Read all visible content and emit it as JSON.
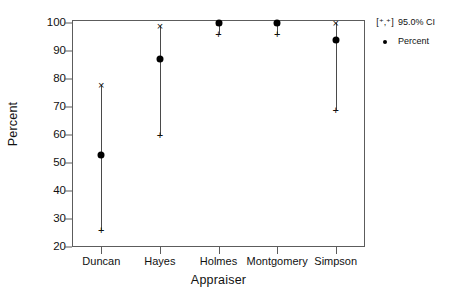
{
  "chart_data": {
    "type": "scatter",
    "title": "",
    "xlabel": "Appraiser",
    "ylabel": "Percent",
    "categories": [
      "Duncan",
      "Hayes",
      "Holmes",
      "Montgomery",
      "Simpson"
    ],
    "values": [
      53,
      87,
      100,
      100,
      94
    ],
    "ci_lower": [
      26,
      60,
      96,
      96,
      69
    ],
    "ci_upper": [
      78,
      99,
      100,
      100,
      100
    ],
    "ylim": [
      20,
      100
    ],
    "yticks": [
      20,
      30,
      40,
      50,
      60,
      70,
      80,
      90,
      100
    ],
    "ytick_labels": [
      "20",
      "30",
      "40",
      "50",
      "60",
      "70",
      "80",
      "90",
      "100"
    ],
    "grid": false,
    "legend_position": "right",
    "series": [
      {
        "name": "Percent",
        "marker": "filled-circle",
        "values": [
          53,
          87,
          100,
          100,
          94
        ]
      },
      {
        "name": "95.0% CI",
        "marker": "[+ , *]",
        "lower": [
          26,
          60,
          96,
          96,
          69
        ],
        "upper": [
          78,
          99,
          100,
          100,
          100
        ]
      }
    ],
    "points": [
      {
        "category": "Duncan",
        "percent": 53,
        "lower": 26,
        "upper": 78
      },
      {
        "category": "Hayes",
        "percent": 87,
        "lower": 60,
        "upper": 99
      },
      {
        "category": "Holmes",
        "percent": 100,
        "lower": 96,
        "upper": 100
      },
      {
        "category": "Montgomery",
        "percent": 100,
        "lower": 96,
        "upper": 100
      },
      {
        "category": "Simpson",
        "percent": 94,
        "lower": 69,
        "upper": 100
      }
    ]
  },
  "axes": {
    "y_title": "Percent",
    "x_title": "Appraiser"
  },
  "legend": {
    "ci_key": "[⁺,⁺]",
    "ci_label": "95.0% CI",
    "percent_key": "dot",
    "percent_label": "Percent"
  },
  "colors": {
    "frame": "#5c5c5c",
    "marker": "#111111",
    "ci_line": "#4a4a4a",
    "background": "#ffffff"
  }
}
